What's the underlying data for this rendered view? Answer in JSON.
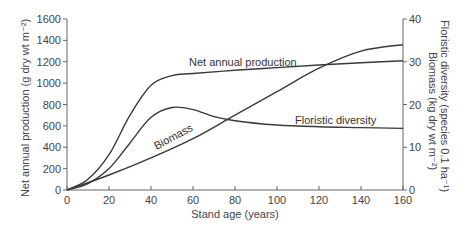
{
  "chart_data": {
    "type": "line",
    "title": "",
    "xlabel": "Stand age (years)",
    "ylabel": "Net annual production (g dry wt m⁻²)",
    "y2label_top": "Floristic diversity (species 0.1 ha⁻¹)",
    "y2label_bottom": "Biomass (kg dry wt m⁻²)",
    "xlim": [
      0,
      160
    ],
    "ylim": [
      0,
      1600
    ],
    "y2lim": [
      0,
      40
    ],
    "grid": false,
    "legend": "inline labels",
    "x_ticks": [
      "0",
      "20",
      "40",
      "60",
      "80",
      "100",
      "120",
      "140",
      "160"
    ],
    "y_ticks": [
      "0",
      "200",
      "400",
      "600",
      "800",
      "1000",
      "1200",
      "1400",
      "1600"
    ],
    "y2_ticks": [
      "0",
      "10",
      "20",
      "30",
      "40"
    ],
    "series": [
      {
        "name": "Net annual production",
        "axis": "left",
        "x": [
          0,
          10,
          20,
          30,
          40,
          50,
          60,
          80,
          100,
          120,
          140,
          160
        ],
        "values": [
          0,
          100,
          330,
          700,
          980,
          1070,
          1090,
          1120,
          1145,
          1170,
          1190,
          1210
        ]
      },
      {
        "name": "Floristic diversity",
        "axis": "right",
        "x": [
          0,
          10,
          20,
          30,
          40,
          50,
          60,
          70,
          80,
          100,
          120,
          140,
          160
        ],
        "values": [
          0,
          1.5,
          5,
          11,
          17,
          19.3,
          18.8,
          17.2,
          16.2,
          15.2,
          14.8,
          14.6,
          14.4
        ]
      },
      {
        "name": "Biomass",
        "axis": "right",
        "x": [
          0,
          20,
          40,
          60,
          80,
          100,
          120,
          140,
          160
        ],
        "values": [
          0,
          3.5,
          7.5,
          12,
          17.5,
          23,
          28.5,
          32.5,
          34
        ]
      }
    ]
  }
}
